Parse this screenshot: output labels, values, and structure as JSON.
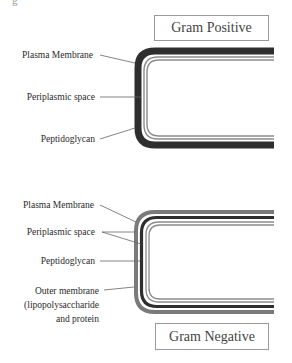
{
  "corner_fragment": "g",
  "gram_positive": {
    "title": "Gram Positive",
    "labels": {
      "plasma_membrane": "Plasma Membrane",
      "periplasmic_space": "Periplasmic space",
      "peptidoglycan": "Peptidoglycan"
    }
  },
  "gram_negative": {
    "title": "Gram Negative",
    "labels": {
      "plasma_membrane": "Plasma Membrane",
      "periplasmic_space": "Periplasmic space",
      "peptidoglycan": "Peptidoglycan",
      "outer_membrane_line1": "Outer membrane",
      "outer_membrane_line2": "(lipopolysaccharide",
      "outer_membrane_line3": "and protein"
    }
  },
  "colors": {
    "peptidoglycan_dark": "#2e2e2e",
    "membrane_gray": "#8c8c8c",
    "leader_line": "#666666",
    "box_border": "#9a9a9a"
  }
}
